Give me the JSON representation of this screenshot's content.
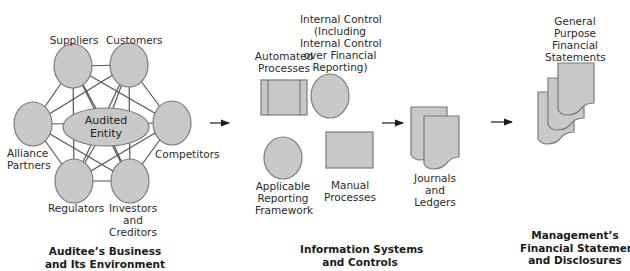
{
  "colors": {
    "shape_fill": "#c8c8c8",
    "shape_stroke": "#7a7a7a",
    "line": "#555555",
    "arrow": "#1a1a1a",
    "text": "#2a2a2a"
  },
  "environment": {
    "center_label_line1": "Audited",
    "center_label_line2": "Entity",
    "nodes": [
      {
        "id": "suppliers",
        "label": "Suppliers"
      },
      {
        "id": "customers",
        "label": "Customers"
      },
      {
        "id": "alliance",
        "label_line1": "Alliance",
        "label_line2": "Partners"
      },
      {
        "id": "competitors",
        "label": "Competitors"
      },
      {
        "id": "regulators",
        "label": "Regulators"
      },
      {
        "id": "investors",
        "label_line1": "Investors",
        "label_line2": "and",
        "label_line3": "Creditors"
      }
    ],
    "caption_line1": "Auditee’s Business",
    "caption_line2": "and Its Environment"
  },
  "information_systems": {
    "automated_line1": "Automated",
    "automated_line2": "Processes",
    "internal_control_lines": [
      "Internal Control",
      "(Including",
      "Internal Control",
      "over Financial",
      "Reporting)"
    ],
    "framework_lines": [
      "Applicable",
      "Reporting",
      "Framework"
    ],
    "manual_line1": "Manual",
    "manual_line2": "Processes",
    "journals_lines": [
      "Journals",
      "and",
      "Ledgers"
    ],
    "caption_line1": "Information Systems",
    "caption_line2": "and Controls"
  },
  "financial_statements": {
    "label_lines": [
      "General",
      "Purpose",
      "Financial",
      "Statements"
    ],
    "caption_line1": "Management’s",
    "caption_line2": "Financial Statements",
    "caption_line3": "and Disclosures"
  },
  "icons": {
    "flow_arrow": "right-arrow",
    "document": "document-shape",
    "process": "predefined-process-shape",
    "manual": "rectangle-shape",
    "control": "circle-shape"
  }
}
